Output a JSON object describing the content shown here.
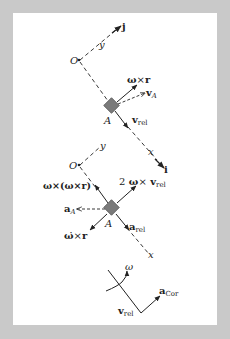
{
  "colors": {
    "frame": "#c9c9c9",
    "panel": "#ffffff",
    "ink": "#222222",
    "block": "#7a7a7a"
  },
  "velocity_diagram": {
    "origin_label": "O",
    "y_axis_label": "y",
    "j_label": "j",
    "point_label": "A",
    "omega_cross_r": {
      "omega": "ω",
      "times": "×",
      "r": "r"
    },
    "vA": {
      "v": "v",
      "sub": "A"
    },
    "vrel": {
      "v": "v",
      "sub": "rel"
    },
    "x_axis_label": "x",
    "i_label": "i"
  },
  "acceleration_diagram": {
    "origin_label": "O",
    "y_axis_label": "y",
    "point_label": "A",
    "centripetal": "ω×(ω×r)",
    "coriolis": {
      "prefix": "2",
      "omega": "ω",
      "times": "×",
      "v": "v",
      "sub": "rel"
    },
    "aA": {
      "a": "a",
      "sub": "A"
    },
    "angular": {
      "omega_dot": "ω̇",
      "times": "×",
      "r": "r"
    },
    "arel": {
      "a": "a",
      "sub": "rel"
    },
    "x_axis_label": "x"
  },
  "coriolis_detail": {
    "omega_label": "ω",
    "acor": {
      "a": "a",
      "sub": "Cor"
    },
    "vrel": {
      "v": "v",
      "sub": "rel"
    }
  }
}
